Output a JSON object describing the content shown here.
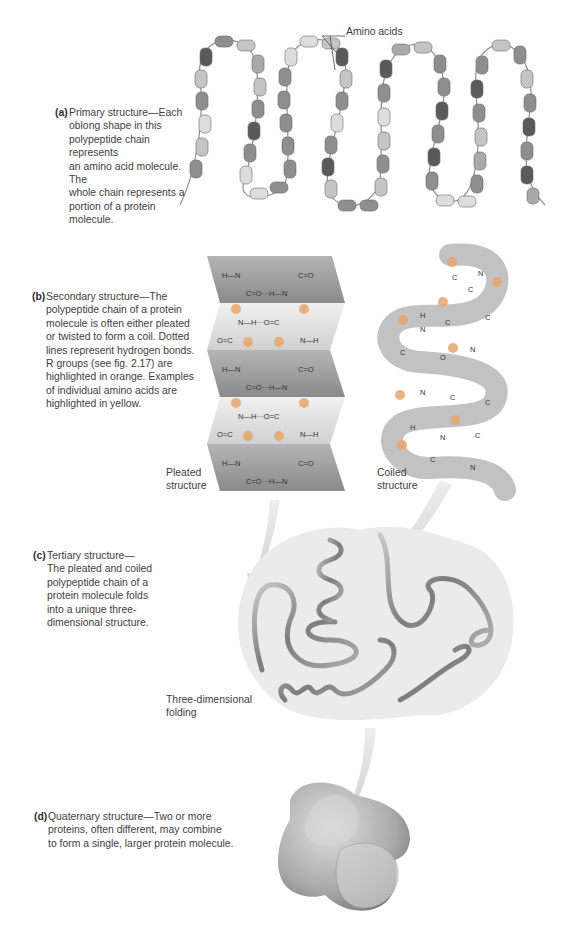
{
  "figure": {
    "panels": [
      {
        "id": "a",
        "tag": "(a)",
        "caption_lines": [
          "Primary structure—Each",
          "oblong shape in this",
          "polypeptide chain represents",
          "an amino acid molecule. The",
          "whole chain represents a",
          "portion of a protein molecule."
        ],
        "labels": {
          "amino_acids": "Amino acids"
        }
      },
      {
        "id": "b",
        "tag": "(b)",
        "caption_lines": [
          "Secondary structure—The",
          "polypeptide chain of a protein",
          "molecule is often either pleated",
          "or twisted to form a coil. Dotted",
          "lines represent hydrogen bonds.",
          "R groups (see fig. 2.17) are",
          "highlighted in orange. Examples",
          "of individual amino acids are",
          "highlighted in yellow."
        ],
        "labels": {
          "pleated_line1": "Pleated",
          "pleated_line2": "structure",
          "coiled_line1": "Coiled",
          "coiled_line2": "structure"
        }
      },
      {
        "id": "c",
        "tag": "(c)",
        "caption_lines": [
          "Tertiary structure—",
          "The pleated and coiled",
          "polypeptide chain of a",
          "protein molecule folds",
          "into a unique three-",
          "dimensional structure."
        ],
        "labels": {
          "folding_line1": "Three-dimensional",
          "folding_line2": "folding"
        }
      },
      {
        "id": "d",
        "tag": "(d)",
        "caption_lines": [
          "Quaternary structure—Two or more",
          "proteins, often different, may combine",
          "to form a single, larger protein molecule."
        ]
      }
    ],
    "chem_symbols": {
      "R": "R",
      "C": "C",
      "N": "N",
      "H": "H",
      "O": "O"
    },
    "colors": {
      "bead_dark": "#5a5a5a",
      "bead_mid": "#8e8e8e",
      "bead_light": "#c4c4c4",
      "bead_pale": "#dcdcdc",
      "sheet_dark": "#8f8f8f",
      "sheet_light": "#e6e6e6",
      "blob_bg": "#ececec",
      "arrow": "#d8d8d8",
      "text": "#3d3d3d"
    }
  }
}
